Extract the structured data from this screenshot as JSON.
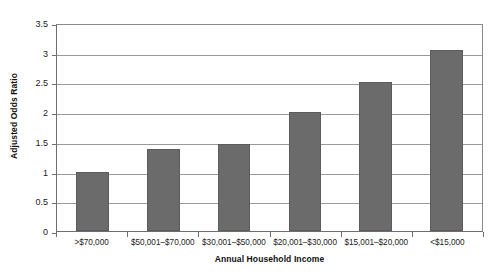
{
  "chart_data": {
    "type": "bar",
    "title": "",
    "xlabel": "Annual Household Income",
    "ylabel": "Adjusted Odds Ratio",
    "categories": [
      ">$70,000",
      "$50,001–$70,000",
      "$30,001–$50,000",
      "$20,001–$30,000",
      "$15,001–$20,000",
      "<$15,000"
    ],
    "values": [
      1.0,
      1.38,
      1.47,
      2.0,
      2.5,
      3.05
    ],
    "ylim": [
      0,
      3.5
    ],
    "ytick_values": [
      0,
      0.5,
      1,
      1.5,
      2,
      2.5,
      3,
      3.5
    ],
    "ytick_labels": [
      "0",
      "0.5",
      "1",
      "1.5",
      "2",
      "2.5",
      "3",
      "3.5"
    ],
    "grid": true,
    "legend": "none",
    "bar_color": "#6b6b6b",
    "gridline_color": "#9a9a9a",
    "axis_color": "#6e6e6e",
    "background_color": "#ffffff"
  }
}
